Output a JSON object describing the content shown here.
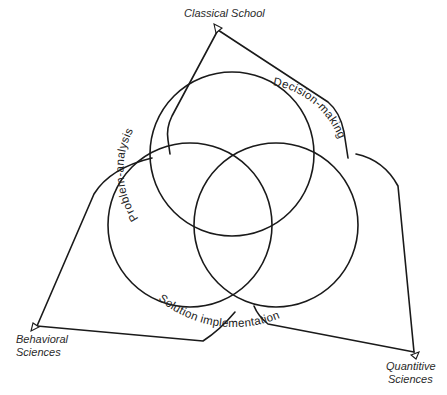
{
  "diagram": {
    "type": "three-circle venn with converging source connectors",
    "sources": [
      {
        "id": "classical",
        "label": "Classical School",
        "lines": [
          "Classical School"
        ]
      },
      {
        "id": "behavioral",
        "label": "Behavioral Sciences",
        "lines": [
          "Behavioral",
          "Sciences"
        ]
      },
      {
        "id": "quantitive",
        "label": "Quantitive Sciences",
        "lines": [
          "Quantitive",
          "Sciences"
        ]
      }
    ],
    "phases": [
      {
        "id": "problem-analysis",
        "label": "Problem-analysis"
      },
      {
        "id": "decision-making",
        "label": "Decision-making"
      },
      {
        "id": "solution-implementation",
        "label": "Solution implementation"
      }
    ],
    "colors": {
      "stroke": "#1a1a1a",
      "text": "#222222",
      "background": "#ffffff"
    }
  }
}
